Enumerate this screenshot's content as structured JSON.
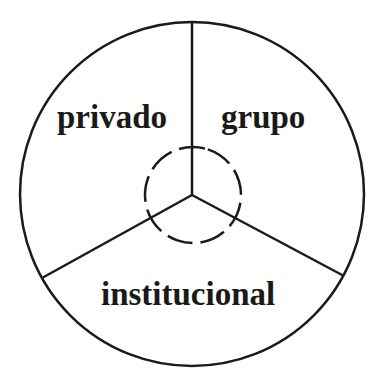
{
  "diagram": {
    "type": "circle-divided-into-three-sectors",
    "stroke_color": "#1a1a1a",
    "background": "#ffffff",
    "sectors": [
      {
        "label": "privado",
        "position": "upper-left"
      },
      {
        "label": "grupo",
        "position": "upper-right"
      },
      {
        "label": "institucional",
        "position": "bottom"
      }
    ],
    "center_element": "dashed-circle"
  }
}
